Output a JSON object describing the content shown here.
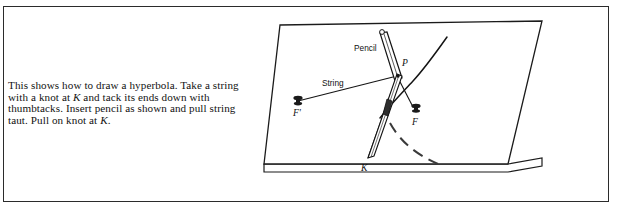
{
  "figure": {
    "kind": "textbook-illustration",
    "caption": {
      "line_1": "This shows how to draw a hyperbola. Take a string with a",
      "line_2_a": "knot at ",
      "line_2_k": "K",
      "line_2_b": " and tack its ends down with thumbtacks. Insert",
      "line_3_a": "pencil as shown and pull string taut. Pull on knot at ",
      "line_3_k": "K",
      "line_3_b": "."
    },
    "labels": {
      "pencil": "Pencil",
      "string": "String",
      "point_p": "P",
      "focus_f": "F",
      "focus_f_prime": "F'",
      "knot_k": "K"
    },
    "colors": {
      "ink": "#111111",
      "frame": "#2b2b2b",
      "board_fill": "#ffffff",
      "dashed_curve": "#3a3a3a"
    }
  }
}
